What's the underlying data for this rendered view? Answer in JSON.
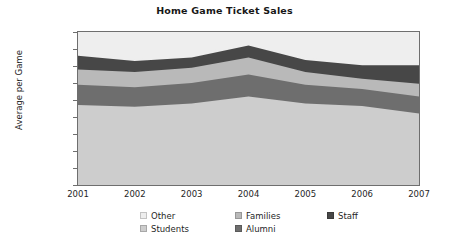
{
  "chart": {
    "title": "Home Game Ticket Sales",
    "ylabel": "Average per Game"
  },
  "yticks": [
    {
      "label": "90,000",
      "value": 90000
    },
    {
      "label": "80,000",
      "value": 80000
    },
    {
      "label": "70,000",
      "value": 70000
    },
    {
      "label": "60,000",
      "value": 60000
    },
    {
      "label": "50,000",
      "value": 50000
    },
    {
      "label": "40,000",
      "value": 40000
    },
    {
      "label": "30,000",
      "value": 30000
    },
    {
      "label": "20,000",
      "value": 20000
    },
    {
      "label": "10,000",
      "value": 10000
    },
    {
      "label": "0",
      "value": 0
    }
  ],
  "xticks": [
    {
      "label": "2001"
    },
    {
      "label": "2002"
    },
    {
      "label": "2003"
    },
    {
      "label": "2004"
    },
    {
      "label": "2005"
    },
    {
      "label": "2006"
    },
    {
      "label": "2007"
    }
  ],
  "legend": {
    "items": [
      {
        "label": "Other",
        "color": "#eeeeee"
      },
      {
        "label": "Families",
        "color": "#b9b9b9"
      },
      {
        "label": "Staff",
        "color": "#474747"
      },
      {
        "label": "Students",
        "color": "#cdcdcd"
      },
      {
        "label": "Alumni",
        "color": "#6e6e6e"
      }
    ]
  },
  "chart_data": {
    "type": "area",
    "stacked": true,
    "title": "Home Game Ticket Sales",
    "xlabel": "",
    "ylabel": "Average per Game",
    "ylim": [
      0,
      90000
    ],
    "ytick_step": 10000,
    "grid": false,
    "legend_position": "bottom",
    "categories": [
      "2001",
      "2002",
      "2003",
      "2004",
      "2005",
      "2006",
      "2007"
    ],
    "stack_order_bottom_to_top": [
      "Students",
      "Alumni",
      "Families",
      "Staff",
      "Other"
    ],
    "series": [
      {
        "name": "Students",
        "color": "#cdcdcd",
        "values": [
          47000,
          46000,
          48000,
          52000,
          48000,
          46500,
          42000
        ]
      },
      {
        "name": "Alumni",
        "color": "#6e6e6e",
        "values": [
          12000,
          11500,
          12000,
          13000,
          11000,
          10000,
          10000
        ]
      },
      {
        "name": "Families",
        "color": "#b9b9b9",
        "values": [
          9000,
          9000,
          9000,
          10000,
          7500,
          6000,
          7500
        ]
      },
      {
        "name": "Staff",
        "color": "#474747",
        "values": [
          8000,
          6500,
          6000,
          7000,
          7000,
          8000,
          11000
        ]
      },
      {
        "name": "Other",
        "color": "#eeeeee",
        "values": [
          2000,
          1000,
          1000,
          3500,
          1500,
          2000,
          1500
        ]
      }
    ],
    "cumulative_tops": {
      "Students": [
        47000,
        46000,
        48000,
        52000,
        48000,
        46500,
        42000
      ],
      "Alumni": [
        59000,
        57500,
        60000,
        65000,
        59000,
        56500,
        52000
      ],
      "Families": [
        68000,
        66500,
        69000,
        75000,
        66500,
        62500,
        59500
      ],
      "Staff": [
        76000,
        73000,
        75000,
        82000,
        73500,
        70500,
        70500
      ],
      "Other": [
        78000,
        74000,
        76000,
        85500,
        75000,
        72500,
        72000
      ]
    },
    "totals": [
      78000,
      74000,
      76000,
      85500,
      75000,
      72500,
      72000
    ]
  }
}
